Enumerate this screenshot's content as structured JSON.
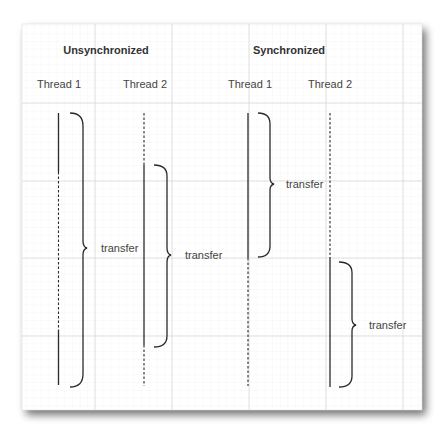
{
  "colors": {
    "paper": "#ffffff",
    "grid_minor": "#ececec",
    "grid_major": "#d6d6d6",
    "line": "#2a2a2a",
    "text": "#333333",
    "shadow": "#7a7a7a"
  },
  "sections": [
    {
      "title": "Unsynchronized",
      "threads": [
        {
          "label": "Thread 1"
        },
        {
          "label": "Thread 2"
        }
      ],
      "annotations": [
        {
          "label": "transfer"
        },
        {
          "label": "transfer"
        }
      ]
    },
    {
      "title": "Synchronized",
      "threads": [
        {
          "label": "Thread 1"
        },
        {
          "label": "Thread 2"
        }
      ],
      "annotations": [
        {
          "label": "transfer"
        },
        {
          "label": "transfer"
        }
      ]
    }
  ]
}
